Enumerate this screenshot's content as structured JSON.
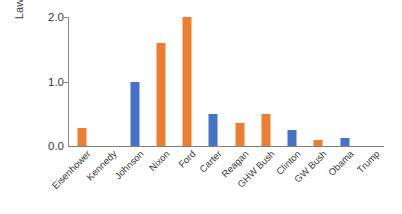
{
  "chart_data": {
    "type": "bar",
    "title": "",
    "subtitle": "",
    "xlabel": "",
    "ylabel": "Laws per year",
    "ylim": [
      0.0,
      2.0
    ],
    "yticks": [
      "0.0",
      "1.0",
      "2.0"
    ],
    "ytick_values": [
      0.0,
      1.0,
      2.0
    ],
    "grid": false,
    "legend": "none",
    "categories": [
      "Eisenhower",
      "Kennedy",
      "Johnson",
      "Nixon",
      "Ford",
      "Carter",
      "Reagan",
      "GHW Bush",
      "Clinton",
      "GW Bush",
      "Obama",
      "Trump"
    ],
    "values": [
      0.28,
      0.0,
      1.0,
      1.6,
      2.0,
      0.5,
      0.35,
      0.5,
      0.25,
      0.1,
      0.13,
      0.0
    ],
    "bar_colors": [
      "#ED7D31",
      "#4472C4",
      "#4472C4",
      "#ED7D31",
      "#ED7D31",
      "#4472C4",
      "#ED7D31",
      "#ED7D31",
      "#4472C4",
      "#ED7D31",
      "#4472C4",
      "#ED7D31"
    ]
  },
  "colors": {
    "republican": "#ED7D31",
    "democrat": "#4472C4",
    "axis": "#7f7f7f",
    "text": "#3a3a3a",
    "background": "#ffffff"
  }
}
